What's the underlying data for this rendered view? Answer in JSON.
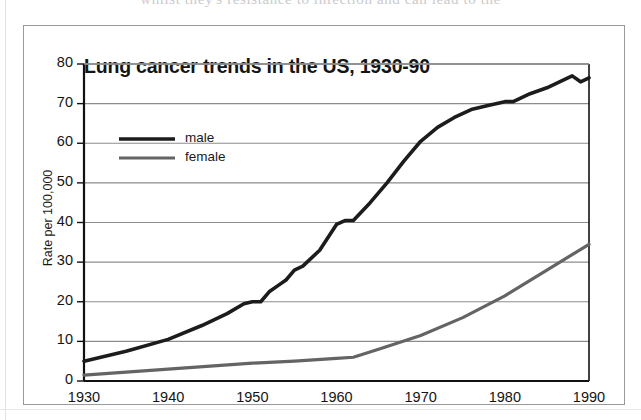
{
  "page": {
    "top_cut_text": "whilst they's resistance to infection and can lead to the"
  },
  "figure": {
    "title": "Lung cancer trends in the US, 1930-90"
  },
  "chart_data": {
    "type": "line",
    "title": "Lung cancer trends in the US, 1930-90",
    "xlabel": "",
    "ylabel": "Rate per 100,000",
    "xlim": [
      1930,
      1990
    ],
    "ylim": [
      0,
      80
    ],
    "xticks": [
      1930,
      1940,
      1950,
      1960,
      1970,
      1980,
      1990
    ],
    "yticks": [
      0,
      10,
      20,
      30,
      40,
      50,
      60,
      70,
      80
    ],
    "grid": "horizontal",
    "legend_position": "top-left-inside",
    "series": [
      {
        "name": "male",
        "color": "#1c1c1c",
        "line_width": 3.6,
        "x": [
          1930,
          1935,
          1940,
          1944,
          1947,
          1949,
          1950,
          1951,
          1952,
          1953,
          1954,
          1955,
          1956,
          1958,
          1960,
          1961,
          1962,
          1964,
          1966,
          1968,
          1970,
          1972,
          1974,
          1976,
          1978,
          1980,
          1981,
          1983,
          1985,
          1987,
          1988,
          1989,
          1990
        ],
        "y": [
          5,
          7.5,
          10.5,
          14,
          17,
          19.5,
          20,
          20,
          22.5,
          24,
          25.5,
          28,
          29,
          33,
          39.5,
          40.5,
          40.5,
          45,
          50,
          55.5,
          60.5,
          64,
          66.5,
          68.5,
          69.5,
          70.5,
          70.5,
          72.5,
          74,
          76,
          77,
          75.5,
          76.5
        ]
      },
      {
        "name": "female",
        "color": "#646464",
        "line_width": 3.2,
        "x": [
          1930,
          1940,
          1950,
          1955,
          1960,
          1962,
          1965,
          1970,
          1975,
          1980,
          1985,
          1990
        ],
        "y": [
          1.5,
          3,
          4.5,
          5,
          5.7,
          6,
          8,
          11.5,
          16,
          21.5,
          28,
          34.5
        ]
      }
    ],
    "legend": [
      {
        "label": "male"
      },
      {
        "label": "female"
      }
    ]
  },
  "colors": {
    "male_line": "#1c1c1c",
    "female_line": "#646464",
    "gridline": "#8c8c8c",
    "axis": "#111111",
    "frame": "#9a9a9c"
  }
}
